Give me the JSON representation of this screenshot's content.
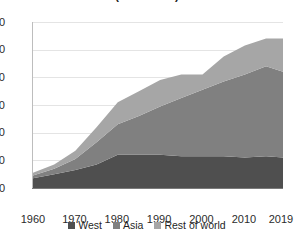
{
  "chart_data": {
    "type": "area",
    "stacked": true,
    "title": "(in million t)",
    "xlabel": "",
    "ylabel": "",
    "x": [
      1960,
      1965,
      1970,
      1975,
      1980,
      1985,
      1990,
      1995,
      2000,
      2005,
      2010,
      2015,
      2019
    ],
    "tick_x": [
      "1960",
      "1970",
      "1980",
      "1990",
      "2000",
      "2010",
      "2019"
    ],
    "tick_y": [
      "0",
      "20",
      "40",
      "60",
      "80",
      "100",
      "120"
    ],
    "xlim": [
      1960,
      2019
    ],
    "ylim": [
      0,
      120
    ],
    "grid": true,
    "legend_position": "bottom",
    "series": [
      {
        "name": "West",
        "color": "#4f4f4f",
        "values": [
          7,
          10,
          13,
          17,
          24,
          24,
          24,
          23,
          23,
          23,
          22,
          23,
          22
        ]
      },
      {
        "name": "Asia",
        "color": "#808080",
        "values": [
          2,
          4,
          8,
          16,
          22,
          28,
          35,
          42,
          48,
          54,
          60,
          65,
          62
        ]
      },
      {
        "name": "Rest of world",
        "color": "#a6a6a6",
        "values": [
          2,
          3,
          6,
          11,
          16,
          18,
          19,
          17,
          11,
          18,
          21,
          20,
          24
        ]
      }
    ],
    "totals": [
      11,
      17,
      27,
      44,
      62,
      70,
      78,
      82,
      82,
      95,
      103,
      108,
      108
    ]
  },
  "legend": {
    "items": [
      {
        "label": "West",
        "color": "#4f4f4f"
      },
      {
        "label": "Asia",
        "color": "#808080"
      },
      {
        "label": "Rest of world",
        "color": "#a6a6a6"
      }
    ]
  }
}
